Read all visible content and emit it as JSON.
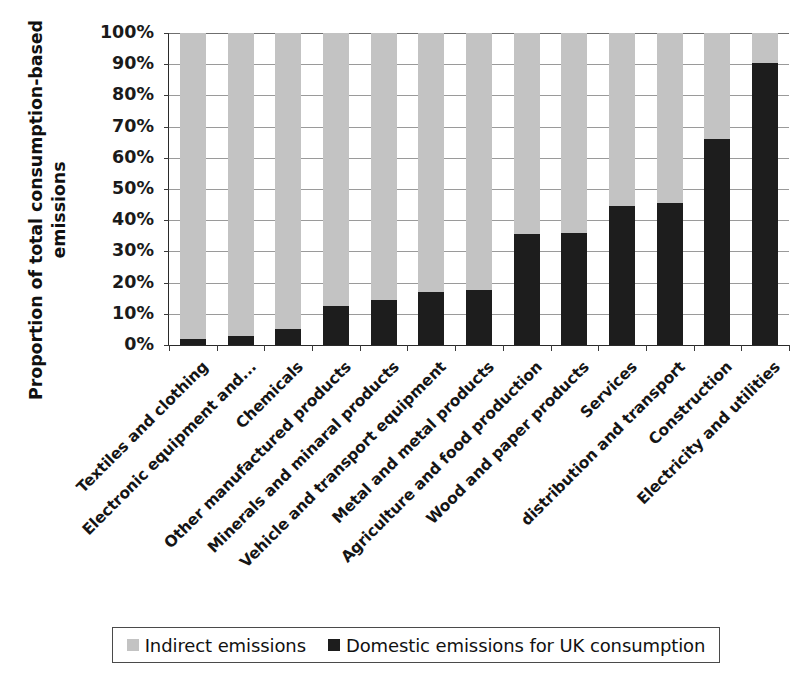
{
  "chart_data": {
    "type": "bar",
    "subtype": "stacked-100-percent",
    "title": "",
    "xlabel": "",
    "ylabel": "Proportion of total consumption-based emissions",
    "ylabel_lines": [
      "Proportion of total consumption-based",
      "emissions"
    ],
    "ylim": [
      0,
      100
    ],
    "ytick_labels": [
      "0%",
      "10%",
      "20%",
      "30%",
      "40%",
      "50%",
      "60%",
      "70%",
      "80%",
      "90%",
      "100%"
    ],
    "ytick_values": [
      0,
      10,
      20,
      30,
      40,
      50,
      60,
      70,
      80,
      90,
      100
    ],
    "grid": true,
    "legend_position": "bottom",
    "categories": [
      "Textiles and clothing",
      "Electronic equipment and...",
      "Chemicals",
      "Other manufactured products",
      "Minerals and minaral products",
      "Vehicle and transport equipment",
      "Metal and metal products",
      "Agriculture and food production",
      "Wood and paper products",
      "Services",
      "distribution and transport",
      "Construction",
      "Electricity and utilities"
    ],
    "series": [
      {
        "name": "Domestic emissions for UK consumption",
        "color": "#1d1d1d",
        "values": [
          2,
          3,
          5,
          12.5,
          14.5,
          17,
          17.5,
          35.5,
          36,
          44.5,
          45.5,
          66,
          90.5
        ]
      },
      {
        "name": "Indirect emissions",
        "color": "#c3c3c3",
        "values": [
          98,
          97,
          95,
          87.5,
          85.5,
          83,
          82.5,
          64.5,
          64,
          55.5,
          54.5,
          34,
          9.5
        ]
      }
    ]
  },
  "legend": {
    "items": [
      {
        "label": "Indirect emissions",
        "color": "#c3c3c3"
      },
      {
        "label": "Domestic emissions for UK consumption",
        "color": "#1d1d1d"
      }
    ]
  }
}
